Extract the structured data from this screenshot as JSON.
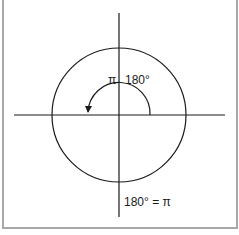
{
  "diagram": {
    "title": "",
    "labels": {
      "pi": "π",
      "angle": "180°",
      "equation": "180° = π"
    },
    "colors": {
      "stroke": "#1a1a1a",
      "border": "#a8a8a8",
      "background": "#ffffff"
    },
    "elements": [
      {
        "type": "circle",
        "name": "unit-circle"
      },
      {
        "type": "axis",
        "name": "x-axis"
      },
      {
        "type": "axis",
        "name": "y-axis"
      },
      {
        "type": "arc-arrow",
        "name": "angle-arc",
        "from_deg": 0,
        "to_deg": 180,
        "direction": "counterclockwise"
      }
    ]
  }
}
